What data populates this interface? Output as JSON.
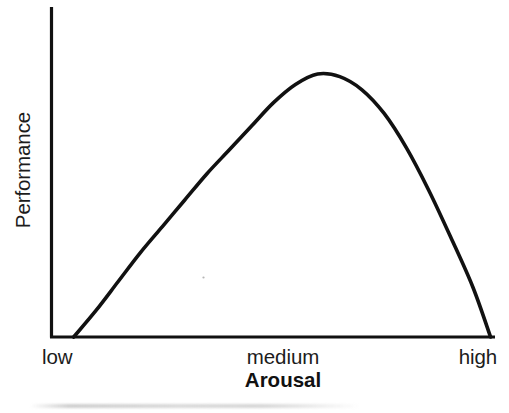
{
  "chart_data": {
    "type": "line",
    "title": "",
    "xlabel": "Arousal",
    "ylabel": "Performance",
    "x_tick_labels": [
      "low",
      "medium",
      "high"
    ],
    "y_tick_labels": [],
    "grid": false,
    "legend": null,
    "axis_style": "open-L-frame",
    "xlim": [
      0,
      1
    ],
    "ylim": [
      0,
      1
    ],
    "annotations": [],
    "series": [
      {
        "name": "Arousal-performance curve",
        "shape": "inverted-U",
        "description": "Performance rises with arousal to a maximum at medium arousal, then declines to zero at high arousal (Yerkes-Dodson law).",
        "points": [
          {
            "x": 0.05,
            "y": 0.0
          },
          {
            "x": 0.1,
            "y": 0.1
          },
          {
            "x": 0.15,
            "y": 0.21
          },
          {
            "x": 0.2,
            "y": 0.32
          },
          {
            "x": 0.25,
            "y": 0.42
          },
          {
            "x": 0.3,
            "y": 0.52
          },
          {
            "x": 0.35,
            "y": 0.62
          },
          {
            "x": 0.4,
            "y": 0.71
          },
          {
            "x": 0.45,
            "y": 0.8
          },
          {
            "x": 0.5,
            "y": 0.89
          },
          {
            "x": 0.55,
            "y": 0.96
          },
          {
            "x": 0.6,
            "y": 1.0
          },
          {
            "x": 0.65,
            "y": 0.99
          },
          {
            "x": 0.7,
            "y": 0.94
          },
          {
            "x": 0.75,
            "y": 0.85
          },
          {
            "x": 0.8,
            "y": 0.72
          },
          {
            "x": 0.85,
            "y": 0.56
          },
          {
            "x": 0.9,
            "y": 0.38
          },
          {
            "x": 0.95,
            "y": 0.19
          },
          {
            "x": 0.99,
            "y": 0.0
          }
        ],
        "peak": {
          "x": 0.6,
          "y": 1.0,
          "label": "medium"
        }
      }
    ]
  },
  "colors": {
    "curve": "#111111",
    "axis": "#111111",
    "text": "#1c1c1c",
    "background": "#ffffff"
  }
}
